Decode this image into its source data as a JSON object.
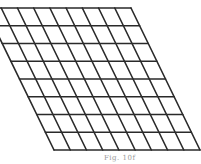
{
  "figure": {
    "caption": "Fig. 10f",
    "grid": {
      "rows": 8,
      "columns": 9,
      "top_left": [
        -15,
        8
      ],
      "top_right": [
        131,
        8
      ],
      "bottom_left": [
        54,
        150
      ],
      "bottom_right": [
        200,
        150
      ],
      "line_color": "#2a2a2a",
      "line_width": 1.6
    }
  }
}
